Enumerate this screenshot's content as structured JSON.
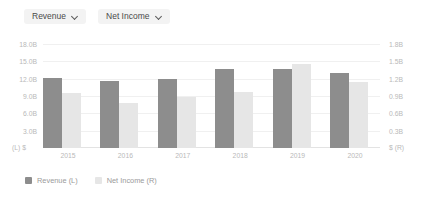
{
  "toolbar": {
    "dropdowns": [
      {
        "label": "Revenue",
        "icon": "chevron-down-icon"
      },
      {
        "label": "Net Income",
        "icon": "chevron-down-icon"
      }
    ]
  },
  "axis": {
    "left_corner": "(L)  $",
    "right_corner": "$  (R)"
  },
  "legend": {
    "items": [
      {
        "label": "Revenue (L)",
        "color": "#8d8d8d"
      },
      {
        "label": "Net Income (R)",
        "color": "#e6e6e6"
      }
    ]
  },
  "chart_data": {
    "type": "bar",
    "title": "",
    "xlabel": "",
    "categories": [
      "2015",
      "2016",
      "2017",
      "2018",
      "2019",
      "2020"
    ],
    "series": [
      {
        "name": "Revenue (L)",
        "axis": "left",
        "color": "#8d8d8d",
        "values": [
          12.2,
          11.6,
          11.9,
          13.7,
          13.6,
          13.0
        ],
        "unit": "B"
      },
      {
        "name": "Net Income (R)",
        "axis": "right",
        "color": "#e6e6e6",
        "values": [
          0.95,
          0.78,
          0.88,
          0.97,
          1.45,
          1.15
        ],
        "unit": "B"
      }
    ],
    "left_axis": {
      "label": "(L)  $",
      "ticks": [
        "18.0B",
        "15.0B",
        "12.0B",
        "9.0B",
        "6.0B",
        "3.0B"
      ],
      "tick_values": [
        18,
        15,
        12,
        9,
        6,
        3
      ],
      "ylim": [
        0,
        18
      ]
    },
    "right_axis": {
      "label": "$  (R)",
      "ticks": [
        "1.8B",
        "1.5B",
        "1.2B",
        "0.9B",
        "0.6B",
        "0.3B"
      ],
      "tick_values": [
        1.8,
        1.5,
        1.2,
        0.9,
        0.6,
        0.3
      ],
      "ylim": [
        0,
        1.8
      ]
    },
    "grid": true,
    "legend_position": "bottom-left"
  }
}
